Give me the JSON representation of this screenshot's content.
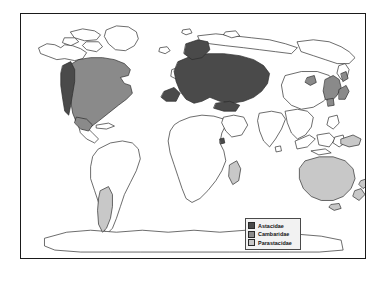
{
  "figure": {
    "type": "distribution-map",
    "projection": "world",
    "background_color": "#ffffff",
    "frame_color": "#1a1a1a",
    "land_outline_color": "#2b2b2b",
    "land_fill_color": "#ffffff"
  },
  "legend": {
    "position": "bottom-right",
    "background_color": "#f2f2f2",
    "border_color": "#4a4a4a",
    "items": [
      {
        "label": "Astacidae",
        "color": "#4a4a4a",
        "swatch_name": "legend-swatch-astacidae"
      },
      {
        "label": "Cambaridae",
        "color": "#8a8a8a",
        "swatch_name": "legend-swatch-cambaridae"
      },
      {
        "label": "Parastacidae",
        "color": "#c8c8c8",
        "swatch_name": "legend-swatch-parastacidae"
      }
    ]
  },
  "map_data": {
    "type": "choropleth-range",
    "categories": [
      "Astacidae",
      "Cambaridae",
      "Parastacidae"
    ],
    "colors": {
      "Astacidae": "#4a4a4a",
      "Cambaridae": "#8a8a8a",
      "Parastacidae": "#c8c8c8"
    },
    "ranges": [
      {
        "family": "Astacidae",
        "color": "#4a4a4a",
        "regions": [
          "Europe",
          "Western Russia",
          "Asia Minor",
          "Pacific Northwest of North America"
        ]
      },
      {
        "family": "Cambaridae",
        "color": "#8a8a8a",
        "regions": [
          "Eastern and Central North America",
          "Mexico",
          "Central America",
          "East Asia",
          "Japan"
        ]
      },
      {
        "family": "Parastacidae",
        "color": "#c8c8c8",
        "regions": [
          "Australia",
          "New Guinea",
          "New Zealand",
          "Southern South America",
          "Madagascar"
        ]
      }
    ]
  }
}
